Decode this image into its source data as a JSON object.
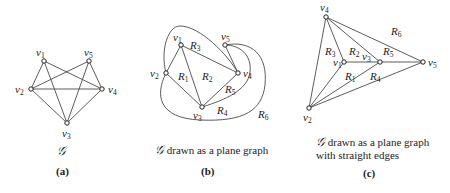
{
  "panels": {
    "a": {
      "label": "(a)",
      "caption": "𝒢",
      "vertices": [
        {
          "id": "v1",
          "name": "v",
          "sub": "1",
          "x": 44,
          "y": 61
        },
        {
          "id": "v2",
          "name": "v",
          "sub": "2",
          "x": 31,
          "y": 89
        },
        {
          "id": "v3",
          "name": "v",
          "sub": "3",
          "x": 67,
          "y": 123
        },
        {
          "id": "v4",
          "name": "v",
          "sub": "4",
          "x": 102,
          "y": 89
        },
        {
          "id": "v5",
          "name": "v",
          "sub": "5",
          "x": 89,
          "y": 61
        }
      ],
      "edges": [
        [
          "v1",
          "v2"
        ],
        [
          "v1",
          "v3"
        ],
        [
          "v1",
          "v4"
        ],
        [
          "v2",
          "v3"
        ],
        [
          "v2",
          "v4"
        ],
        [
          "v2",
          "v5"
        ],
        [
          "v3",
          "v4"
        ],
        [
          "v3",
          "v5"
        ],
        [
          "v4",
          "v5"
        ]
      ]
    },
    "b": {
      "label": "(b)",
      "caption_symbol": "𝒢",
      "caption_text": " drawn as a plane graph",
      "vertices": [
        {
          "id": "v1",
          "name": "v",
          "sub": "1",
          "x": 181,
          "y": 45
        },
        {
          "id": "v2",
          "name": "v",
          "sub": "2",
          "x": 166,
          "y": 73
        },
        {
          "id": "v3",
          "name": "v",
          "sub": "3",
          "x": 202,
          "y": 107
        },
        {
          "id": "v4",
          "name": "v",
          "sub": "4",
          "x": 238,
          "y": 73
        },
        {
          "id": "v5",
          "name": "v",
          "sub": "5",
          "x": 225,
          "y": 45
        }
      ],
      "regions": [
        {
          "name": "R",
          "sub": "1",
          "x": 179,
          "y": 80
        },
        {
          "name": "R",
          "sub": "2",
          "x": 203,
          "y": 80
        },
        {
          "name": "R",
          "sub": "3",
          "x": 191,
          "y": 49
        },
        {
          "name": "R",
          "sub": "4",
          "x": 218,
          "y": 114
        },
        {
          "name": "R",
          "sub": "5",
          "x": 226,
          "y": 93
        },
        {
          "name": "R",
          "sub": "6",
          "x": 259,
          "y": 118
        }
      ]
    },
    "c": {
      "label": "(c)",
      "caption_symbol": "𝒢",
      "caption_line1": " drawn as a plane graph",
      "caption_line2": "with straight edges",
      "vertices": [
        {
          "id": "v1",
          "name": "v",
          "sub": "1",
          "x": 344,
          "y": 62
        },
        {
          "id": "v2",
          "name": "v",
          "sub": "2",
          "x": 309,
          "y": 108
        },
        {
          "id": "v3",
          "name": "v",
          "sub": "3",
          "x": 380,
          "y": 62
        },
        {
          "id": "v4",
          "name": "v",
          "sub": "4",
          "x": 326,
          "y": 17
        },
        {
          "id": "v5",
          "name": "v",
          "sub": "5",
          "x": 423,
          "y": 62
        }
      ],
      "edges": [
        [
          "v4",
          "v2"
        ],
        [
          "v4",
          "v1"
        ],
        [
          "v4",
          "v3"
        ],
        [
          "v4",
          "v5"
        ],
        [
          "v1",
          "v2"
        ],
        [
          "v1",
          "v3"
        ],
        [
          "v3",
          "v2"
        ],
        [
          "v3",
          "v5"
        ],
        [
          "v5",
          "v2"
        ]
      ],
      "regions": [
        {
          "name": "R",
          "sub": "1",
          "x": 346,
          "y": 80
        },
        {
          "name": "R",
          "sub": "2",
          "x": 350,
          "y": 57
        },
        {
          "name": "R",
          "sub": "3",
          "x": 327,
          "y": 57
        },
        {
          "name": "R",
          "sub": "4",
          "x": 372,
          "y": 80
        },
        {
          "name": "R",
          "sub": "5",
          "x": 384,
          "y": 57
        },
        {
          "name": "R",
          "sub": "6",
          "x": 392,
          "y": 35
        }
      ]
    }
  }
}
